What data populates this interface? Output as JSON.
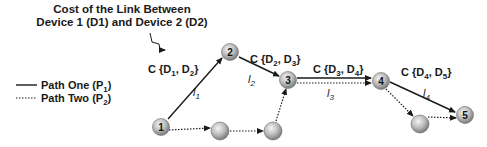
{
  "annotation": {
    "title_line1": "Cost of the Link Between",
    "title_line2": "Device 1 (D1) and Device 2 (D2)"
  },
  "legend": {
    "items": [
      {
        "label": "Path One (P",
        "sub": "1",
        "close": ")",
        "style": "solid"
      },
      {
        "label": "Path Two (P",
        "sub": "2",
        "close": ")",
        "style": "dotted"
      }
    ]
  },
  "nodes": [
    {
      "id": "1",
      "label": "1"
    },
    {
      "id": "2",
      "label": "2"
    },
    {
      "id": "3",
      "label": "3"
    },
    {
      "id": "4",
      "label": "4"
    },
    {
      "id": "5",
      "label": "5"
    },
    {
      "id": "p2a",
      "label": ""
    },
    {
      "id": "p2b",
      "label": ""
    },
    {
      "id": "p2c",
      "label": ""
    }
  ],
  "costs": [
    {
      "prefix": "C {D",
      "a": "1",
      "mid": ", D",
      "b": "2",
      "suffix": "}"
    },
    {
      "prefix": "C {D",
      "a": "2",
      "mid": ", D",
      "b": "3",
      "suffix": "}"
    },
    {
      "prefix": "C {D",
      "a": "3",
      "mid": ", D",
      "b": "4",
      "suffix": "}"
    },
    {
      "prefix": "C {D",
      "a": "4",
      "mid": ", D",
      "b": "5",
      "suffix": "}"
    }
  ],
  "links": [
    {
      "name": "l",
      "sub": "1"
    },
    {
      "name": "l",
      "sub": "2"
    },
    {
      "name": "l",
      "sub": "3"
    },
    {
      "name": "l",
      "sub": "4"
    }
  ],
  "colors": {
    "edge": "#1a1a1a",
    "node_fill_light": "#e8e8e8",
    "node_fill_dark": "#8a8a8a"
  }
}
